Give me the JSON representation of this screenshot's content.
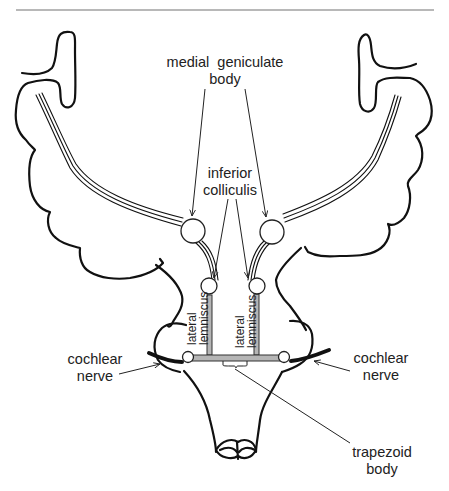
{
  "diagram": {
    "type": "anatomical-pathway",
    "separator_color": "#a0a0a0",
    "labels": {
      "medial_geniculate_line1": "medial  geniculate",
      "medial_geniculate_line2": "body",
      "inferior_colliculis_line1": "inferior",
      "inferior_colliculis_line2": "colliculis",
      "lateral_lemniscus_left_line1": "lateral",
      "lateral_lemniscus_left_line2": "lemniscus",
      "lateral_lemniscus_right_line1": "lateral",
      "lateral_lemniscus_right_line2": "lemniscus",
      "cochlear_left_line1": "cochlear",
      "cochlear_left_line2": "nerve",
      "cochlear_right_line1": "cochlear",
      "cochlear_right_line2": "nerve",
      "trapezoid_line1": "trapezoid",
      "trapezoid_line2": "body"
    },
    "structures": [
      "medial geniculate body (left)",
      "medial geniculate body (right)",
      "inferior colliculis (left)",
      "inferior colliculis (right)",
      "lateral lemniscus (left)",
      "lateral lemniscus (right)",
      "cochlear nucleus (left)",
      "cochlear nucleus (right)",
      "cochlear nerve (left)",
      "cochlear nerve (right)",
      "trapezoid body",
      "auditory radiations (left)",
      "auditory radiations (right)"
    ]
  }
}
